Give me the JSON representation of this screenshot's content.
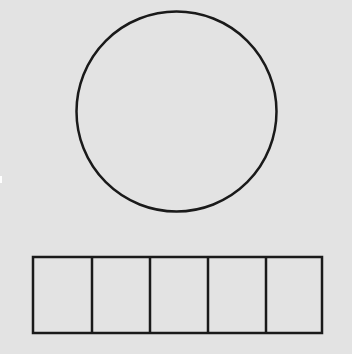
{
  "background_color": "#e3e3e3",
  "stroke_color": "#1a1a1a",
  "circle": {
    "cx": 176.5,
    "cy": 111.5,
    "r": 100,
    "stroke_width": 2.5
  },
  "strip": {
    "x": 33,
    "y": 257,
    "width": 289,
    "height": 76,
    "stroke_width": 2.5,
    "cells": 5,
    "dividers_x": [
      92,
      150,
      208,
      266
    ]
  }
}
